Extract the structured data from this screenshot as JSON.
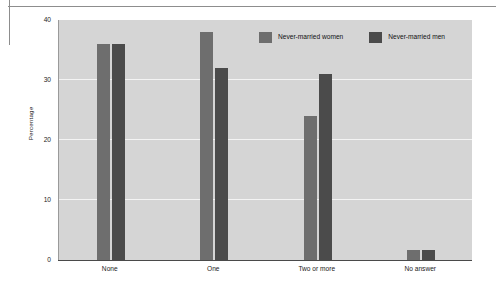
{
  "chart_data": {
    "type": "bar",
    "title": "",
    "subtitle": "",
    "xlabel": "",
    "ylabel": "Percentage",
    "categories": [
      "None",
      "One",
      "Two or more",
      "No answer"
    ],
    "series": [
      {
        "name": "Never-married women",
        "color": "#6e6e6e",
        "values": [
          36,
          38,
          24,
          1.7
        ]
      },
      {
        "name": "Never-married men",
        "color": "#4b4b4b",
        "values": [
          36,
          32,
          31,
          1.7
        ]
      }
    ],
    "ylim": [
      0,
      40
    ],
    "yticks": [
      0,
      10,
      20,
      30,
      40
    ],
    "ytick_labels": [
      "0",
      "10",
      "20",
      "30",
      "40"
    ],
    "grid": true,
    "grid_axis": "y",
    "grid_color": "#f4f4f4",
    "plot_background": "#d5d5d5",
    "legend_position": "top-right-inside"
  },
  "legend": {
    "items": [
      {
        "label": "Never-married women",
        "color": "#6e6e6e"
      },
      {
        "label": "Never-married men",
        "color": "#4b4b4b"
      }
    ]
  }
}
